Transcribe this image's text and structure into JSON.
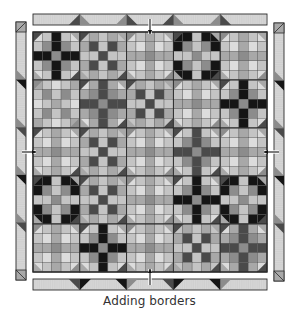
{
  "caption": "Adding borders",
  "colors": {
    "outline": "#2a2a2a",
    "black": "#151515",
    "dark": "#4a4a4a",
    "medium": "#8c8c8c",
    "midlight": "#a8a8a8",
    "light": "#c4c4c4",
    "pale": "#dcdcdc",
    "border_fill": "#d6d6d6",
    "arrow": "#111111"
  },
  "quilt": {
    "rows": 5,
    "cols": 5,
    "blocks": [
      [
        "crossA-black",
        "nineB-dark",
        "snowA-light",
        "crossB-black",
        "snowA-light"
      ],
      [
        "nineA-light",
        "snowB-dark",
        "nineB-dark",
        "snowA-light",
        "crossA-black"
      ],
      [
        "snowA-dark",
        "nineB-dark",
        "snowA-light",
        "crossA-dark",
        "snowA-light"
      ],
      [
        "crossB-black",
        "nineB-dark",
        "snowA-light",
        "crossA-black",
        "crossB-black"
      ],
      [
        "snowA-light",
        "crossA-black",
        "snowA-light",
        "nineB-dark",
        "snowB-dark"
      ]
    ]
  },
  "borders": {
    "top": {
      "segments": 5,
      "marker": "arrow-down-into-quilt"
    },
    "bottom": {
      "segments": 5,
      "marker": "arrow-up-into-quilt"
    },
    "left": {
      "segments": 5,
      "marker": "arrow-right-into-quilt"
    },
    "right": {
      "segments": 5,
      "marker": "arrow-left-into-quilt"
    }
  }
}
